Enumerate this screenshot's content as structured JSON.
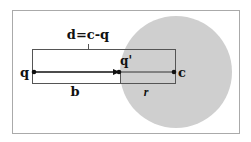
{
  "diagram": {
    "title_label": "d=c-q",
    "points": {
      "q": {
        "label": "q",
        "x": 34,
        "y": 72
      },
      "q_prime": {
        "label": "q'",
        "x": 119,
        "y": 72
      },
      "c": {
        "label": "c",
        "x": 174,
        "y": 72
      }
    },
    "segments": {
      "b": {
        "label": "b"
      },
      "r": {
        "label": "r"
      }
    },
    "circle": {
      "cx": 176,
      "cy": 72,
      "r": 56
    },
    "colors": {
      "frame": "#aaaaaa",
      "box": "#555555",
      "circle_fill": "#cfcfcf",
      "ink": "#111111"
    }
  }
}
